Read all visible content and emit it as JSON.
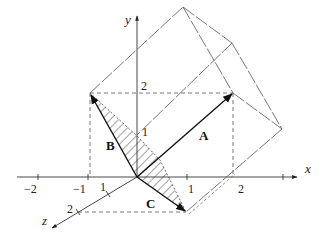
{
  "diagram": {
    "axes": {
      "x_label": "x",
      "y_label": "y",
      "z_label": "z",
      "x_ticks": [
        "−2",
        "−1",
        "1",
        "2"
      ],
      "y_ticks": [
        "1",
        "2"
      ],
      "z_ticks": [
        "1",
        "2"
      ]
    },
    "vectors": [
      {
        "name": "A",
        "components": [
          2,
          2,
          0
        ]
      },
      {
        "name": "B",
        "components": [
          -1,
          2,
          0
        ]
      },
      {
        "name": "C",
        "components": [
          2,
          0,
          2
        ]
      }
    ],
    "shaded_region": "parallelogram spanned by B and C (hatched triangle B–O–C)",
    "solid": "parallelepiped spanned by A, B, C (outlined with long-dash edges)",
    "colors": {
      "ink": "#222222",
      "dash": "#555555"
    }
  }
}
